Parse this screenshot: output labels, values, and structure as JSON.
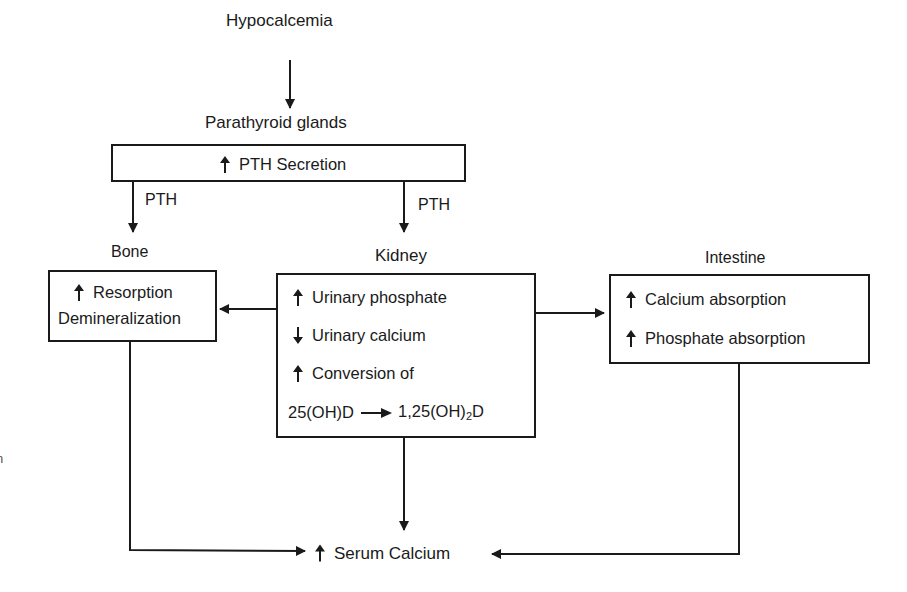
{
  "diagram": {
    "top": {
      "trigger": "Hypocalcemia",
      "gland_label": "Parathyroid glands",
      "secretion": {
        "direction": "up",
        "text": "PTH Secretion"
      }
    },
    "edge_labels": {
      "to_bone": "PTH",
      "to_kidney": "PTH"
    },
    "organs": {
      "bone": {
        "title": "Bone",
        "effects": [
          {
            "direction": "up",
            "text": "Resorption"
          },
          {
            "direction": "none",
            "text": "Demineralization"
          }
        ]
      },
      "kidney": {
        "title": "Kidney",
        "effects": [
          {
            "direction": "up",
            "text": "Urinary phosphate"
          },
          {
            "direction": "down",
            "text": "Urinary calcium"
          },
          {
            "direction": "up",
            "text": "Conversion of"
          }
        ],
        "conversion": {
          "from": "25(OH)D",
          "to_prefix": "1,25(OH)",
          "to_sub": "2",
          "to_suffix": "D"
        }
      },
      "intestine": {
        "title": "Intestine",
        "effects": [
          {
            "direction": "up",
            "text": "Calcium absorption"
          },
          {
            "direction": "up",
            "text": "Phosphate absorption"
          }
        ]
      }
    },
    "outcome": {
      "direction": "up",
      "text": "Serum Calcium"
    },
    "edge_fragment": "n",
    "colors": {
      "line": "#1a1a1a",
      "background": "#ffffff"
    }
  }
}
